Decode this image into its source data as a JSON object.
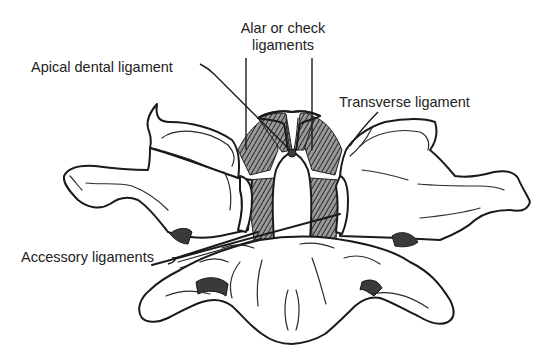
{
  "figure": {
    "labels": {
      "alar": "Alar or check\nligaments",
      "alar_line1": "Alar or check",
      "alar_line2": "ligaments",
      "apical": "Apical dental ligament",
      "transverse": "Transverse ligament",
      "accessory": "Accessory ligaments"
    },
    "colors": {
      "background": "#ffffff",
      "ink": "#1a1a1a",
      "shading": "#3a3a3a"
    }
  }
}
